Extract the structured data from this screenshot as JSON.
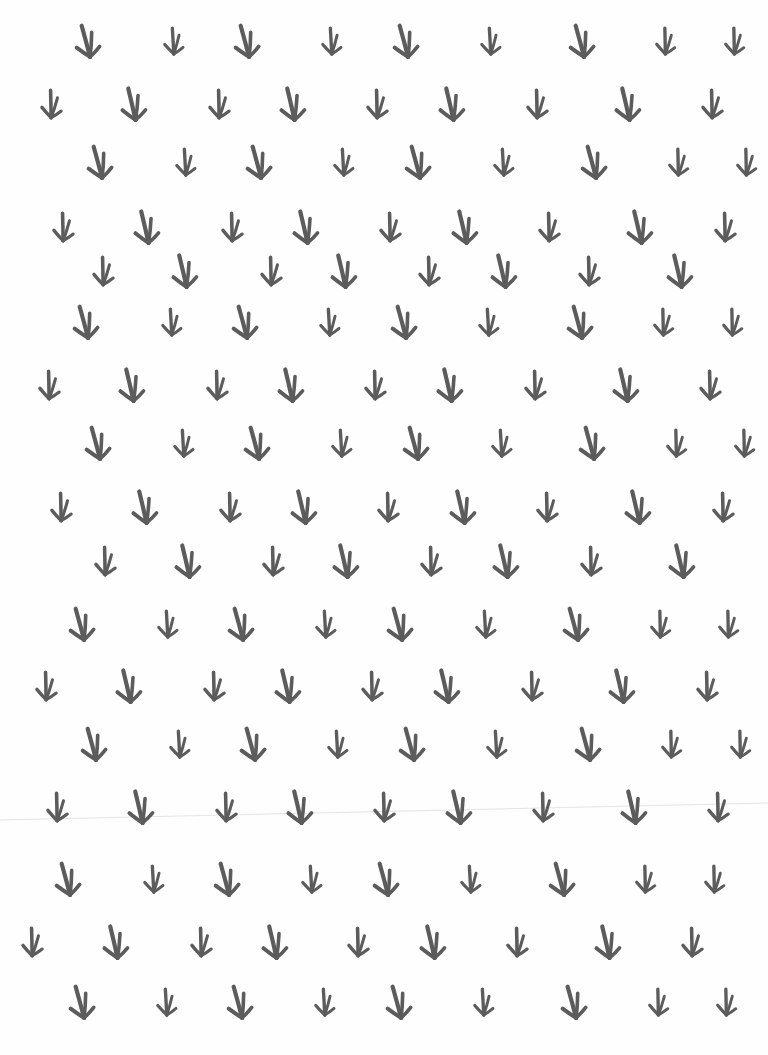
{
  "page": {
    "width": 768,
    "height": 1055,
    "background": "#fefefe"
  },
  "pattern": {
    "motif": "bird-footprint",
    "color": "#5c5c5c",
    "crease": {
      "x1": 0,
      "y1": 820,
      "x2": 768,
      "y2": 803,
      "color": "#e4e4e4"
    },
    "rows": [
      {
        "y": 42,
        "items": [
          [
            88,
            1.0,
            -8
          ],
          [
            175,
            0.8,
            4
          ],
          [
            247,
            1.0,
            -8
          ],
          [
            333,
            0.8,
            4
          ],
          [
            406,
            1.0,
            -8
          ],
          [
            492,
            0.8,
            4
          ],
          [
            582,
            1.0,
            -8
          ],
          [
            667,
            0.8,
            6
          ],
          [
            736,
            0.8,
            6
          ]
        ]
      },
      {
        "y": 105,
        "items": [
          [
            52,
            0.85,
            6
          ],
          [
            134,
            1.0,
            -6
          ],
          [
            220,
            0.85,
            6
          ],
          [
            293,
            1.0,
            -6
          ],
          [
            378,
            0.85,
            6
          ],
          [
            452,
            1.0,
            -6
          ],
          [
            538,
            0.85,
            6
          ],
          [
            628,
            1.0,
            -6
          ],
          [
            713,
            0.85,
            6
          ]
        ]
      },
      {
        "y": 163,
        "items": [
          [
            100,
            1.0,
            -8
          ],
          [
            187,
            0.8,
            4
          ],
          [
            259,
            1.0,
            -8
          ],
          [
            345,
            0.8,
            4
          ],
          [
            418,
            1.0,
            -8
          ],
          [
            505,
            0.8,
            4
          ],
          [
            594,
            1.0,
            -8
          ],
          [
            680,
            0.8,
            6
          ],
          [
            748,
            0.8,
            6
          ]
        ]
      },
      {
        "y": 228,
        "items": [
          [
            64,
            0.85,
            6
          ],
          [
            147,
            1.0,
            -6
          ],
          [
            233,
            0.85,
            6
          ],
          [
            306,
            1.0,
            -6
          ],
          [
            391,
            0.85,
            6
          ],
          [
            465,
            1.0,
            -6
          ],
          [
            550,
            0.85,
            6
          ],
          [
            640,
            1.0,
            -6
          ],
          [
            726,
            0.85,
            6
          ]
        ]
      },
      {
        "y": 272,
        "items": [
          [
            104,
            0.85,
            6
          ],
          [
            185,
            1.0,
            -6
          ],
          [
            272,
            0.85,
            6
          ],
          [
            344,
            1.0,
            -6
          ],
          [
            430,
            0.85,
            6
          ],
          [
            504,
            1.0,
            -6
          ],
          [
            590,
            0.85,
            6
          ],
          [
            680,
            1.0,
            -6
          ]
        ]
      },
      {
        "y": 323,
        "items": [
          [
            86,
            1.0,
            -8
          ],
          [
            173,
            0.8,
            4
          ],
          [
            245,
            1.0,
            -8
          ],
          [
            331,
            0.8,
            4
          ],
          [
            404,
            1.0,
            -8
          ],
          [
            490,
            0.8,
            4
          ],
          [
            580,
            1.0,
            -8
          ],
          [
            665,
            0.8,
            6
          ],
          [
            734,
            0.8,
            6
          ]
        ]
      },
      {
        "y": 386,
        "items": [
          [
            50,
            0.85,
            6
          ],
          [
            132,
            1.0,
            -6
          ],
          [
            218,
            0.85,
            6
          ],
          [
            291,
            1.0,
            -6
          ],
          [
            376,
            0.85,
            6
          ],
          [
            450,
            1.0,
            -6
          ],
          [
            536,
            0.85,
            6
          ],
          [
            626,
            1.0,
            -6
          ],
          [
            711,
            0.85,
            6
          ]
        ]
      },
      {
        "y": 444,
        "items": [
          [
            98,
            1.0,
            -8
          ],
          [
            185,
            0.8,
            4
          ],
          [
            257,
            1.0,
            -8
          ],
          [
            343,
            0.8,
            4
          ],
          [
            416,
            1.0,
            -8
          ],
          [
            503,
            0.8,
            4
          ],
          [
            592,
            1.0,
            -8
          ],
          [
            678,
            0.8,
            6
          ],
          [
            746,
            0.8,
            6
          ]
        ]
      },
      {
        "y": 508,
        "items": [
          [
            62,
            0.85,
            6
          ],
          [
            145,
            1.0,
            -6
          ],
          [
            231,
            0.85,
            6
          ],
          [
            304,
            1.0,
            -6
          ],
          [
            389,
            0.85,
            6
          ],
          [
            463,
            1.0,
            -6
          ],
          [
            548,
            0.85,
            6
          ],
          [
            638,
            1.0,
            -6
          ],
          [
            724,
            0.85,
            6
          ]
        ]
      },
      {
        "y": 562,
        "items": [
          [
            106,
            0.85,
            6
          ],
          [
            188,
            1.0,
            -6
          ],
          [
            274,
            0.85,
            6
          ],
          [
            346,
            1.0,
            -6
          ],
          [
            432,
            0.85,
            6
          ],
          [
            506,
            1.0,
            -6
          ],
          [
            592,
            0.85,
            6
          ],
          [
            682,
            1.0,
            -6
          ]
        ]
      },
      {
        "y": 625,
        "items": [
          [
            82,
            1.0,
            -8
          ],
          [
            169,
            0.8,
            4
          ],
          [
            241,
            1.0,
            -8
          ],
          [
            327,
            0.8,
            4
          ],
          [
            400,
            1.0,
            -8
          ],
          [
            487,
            0.8,
            4
          ],
          [
            576,
            1.0,
            -8
          ],
          [
            662,
            0.8,
            6
          ],
          [
            730,
            0.8,
            6
          ]
        ]
      },
      {
        "y": 687,
        "items": [
          [
            47,
            0.85,
            6
          ],
          [
            129,
            1.0,
            -6
          ],
          [
            215,
            0.85,
            6
          ],
          [
            288,
            1.0,
            -6
          ],
          [
            373,
            0.85,
            6
          ],
          [
            447,
            1.0,
            -6
          ],
          [
            533,
            0.85,
            6
          ],
          [
            622,
            1.0,
            -6
          ],
          [
            708,
            0.85,
            6
          ]
        ]
      },
      {
        "y": 745,
        "items": [
          [
            94,
            1.0,
            -8
          ],
          [
            181,
            0.8,
            4
          ],
          [
            253,
            1.0,
            -8
          ],
          [
            339,
            0.8,
            4
          ],
          [
            412,
            1.0,
            -8
          ],
          [
            498,
            0.8,
            4
          ],
          [
            588,
            1.0,
            -8
          ],
          [
            673,
            0.8,
            6
          ],
          [
            742,
            0.8,
            6
          ]
        ]
      },
      {
        "y": 808,
        "items": [
          [
            58,
            0.85,
            6
          ],
          [
            141,
            1.0,
            -6
          ],
          [
            227,
            0.85,
            6
          ],
          [
            300,
            1.0,
            -6
          ],
          [
            385,
            0.85,
            6
          ],
          [
            459,
            1.0,
            -6
          ],
          [
            544,
            0.85,
            6
          ],
          [
            634,
            1.0,
            -6
          ],
          [
            719,
            0.85,
            6
          ]
        ]
      },
      {
        "y": 880,
        "items": [
          [
            68,
            1.0,
            -8
          ],
          [
            155,
            0.8,
            4
          ],
          [
            227,
            1.0,
            -8
          ],
          [
            313,
            0.8,
            4
          ],
          [
            386,
            1.0,
            -8
          ],
          [
            472,
            0.8,
            4
          ],
          [
            562,
            1.0,
            -8
          ],
          [
            647,
            0.8,
            6
          ],
          [
            716,
            0.8,
            6
          ]
        ]
      },
      {
        "y": 943,
        "items": [
          [
            33,
            0.85,
            6
          ],
          [
            116,
            1.0,
            -6
          ],
          [
            202,
            0.85,
            6
          ],
          [
            275,
            1.0,
            -6
          ],
          [
            359,
            0.85,
            6
          ],
          [
            433,
            1.0,
            -6
          ],
          [
            518,
            0.85,
            6
          ],
          [
            608,
            1.0,
            -6
          ],
          [
            693,
            0.85,
            6
          ]
        ]
      },
      {
        "y": 1003,
        "items": [
          [
            82,
            1.0,
            -8
          ],
          [
            168,
            0.8,
            4
          ],
          [
            240,
            1.0,
            -8
          ],
          [
            326,
            0.8,
            4
          ],
          [
            399,
            1.0,
            -8
          ],
          [
            485,
            0.8,
            4
          ],
          [
            574,
            1.0,
            -8
          ],
          [
            660,
            0.8,
            6
          ],
          [
            728,
            0.8,
            6
          ]
        ]
      }
    ]
  }
}
